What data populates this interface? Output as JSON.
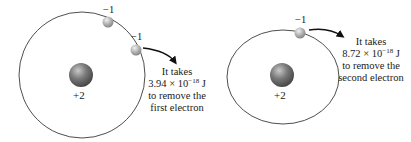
{
  "left_atom": {
    "nucleus_charge": "+2",
    "electrons": [
      {
        "charge": "−1"
      },
      {
        "charge": "−1"
      }
    ],
    "annotation": {
      "line1": "It takes",
      "value_mantissa": "3.94 × 10",
      "value_exponent": "−18",
      "value_unit": " J",
      "line3": "to remove the",
      "line4": "first electron"
    }
  },
  "right_atom": {
    "nucleus_charge": "+2",
    "electrons": [
      {
        "charge": "−1"
      }
    ],
    "annotation": {
      "line1": "It takes",
      "value_mantissa": "8.72 × 10",
      "value_exponent": "−18",
      "value_unit": " J",
      "line3": "to remove the",
      "line4": "second electron"
    }
  },
  "colors": {
    "orbit": "#333333",
    "nucleus": "#6e6e6e",
    "electron": "#a8a8a8",
    "text": "#1a1a1a"
  }
}
